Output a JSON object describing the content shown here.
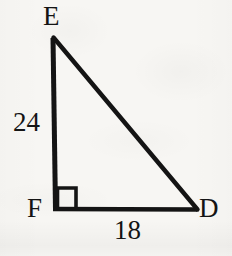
{
  "figure": {
    "kind": "geometry-diagram",
    "shape": "right-triangle",
    "background_color": "#f7f6f3",
    "stroke_color": "#141414",
    "vertices": {
      "E": {
        "label": "E",
        "x": 53,
        "y": 37
      },
      "F": {
        "label": "F",
        "x": 55,
        "y": 210
      },
      "D": {
        "label": "D",
        "x": 197,
        "y": 210
      }
    },
    "vertex_labels": [
      {
        "name": "vertex-label-e",
        "text": "E"
      },
      {
        "name": "vertex-label-f",
        "text": "F"
      },
      {
        "name": "vertex-label-d",
        "text": "D"
      }
    ],
    "side_labels": [
      {
        "name": "side-length-ef",
        "text": "24",
        "side": "EF",
        "position": "left"
      },
      {
        "name": "side-length-fd",
        "text": "18",
        "side": "FD",
        "position": "bottom"
      }
    ],
    "right_angle": {
      "at_vertex": "F",
      "marker": "square",
      "size": 19
    },
    "sides": [
      {
        "name": "leg-ef",
        "from": "E",
        "to": "F",
        "length_label": "24"
      },
      {
        "name": "leg-fd",
        "from": "F",
        "to": "D",
        "length_label": "18"
      },
      {
        "name": "hypotenuse-ed",
        "from": "E",
        "to": "D",
        "length_label": ""
      }
    ]
  }
}
